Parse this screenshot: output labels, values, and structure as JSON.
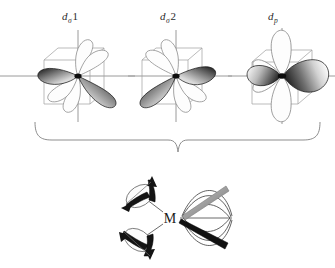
{
  "figure": {
    "title_present": false,
    "background_color": "#ffffff",
    "axis_color": "#9a9a9a",
    "outline_color": "#8d8d8d",
    "lobe_dark_color": "#1c1c1c",
    "lobe_light_color": "#f2f2f2",
    "brace_color": "#8d8d8d"
  },
  "orbitals": [
    {
      "id": "d-sigma-1",
      "label_base": "d",
      "label_sub": "σ",
      "label_num": "1",
      "full_label": "dσ1",
      "shape": "four-lobed cloverleaf, filled lobes on upper-left and lower-right diagonal",
      "center_x": 78,
      "center_y": 76
    },
    {
      "id": "d-sigma-2",
      "label_base": "d",
      "label_sub": "σ",
      "label_num": "2",
      "full_label": "dσ2",
      "shape": "four-lobed cloverleaf, filled lobes on upper-right and lower-left diagonal",
      "center_x": 176,
      "center_y": 76
    },
    {
      "id": "d-p",
      "label_base": "d",
      "label_sub": "p",
      "label_num": "",
      "full_label": "dp",
      "shape": "p-type orbital, filled lobes horizontal with small left lobe and large right lobe, open outline lobes vertical",
      "center_x": 282,
      "center_y": 76
    }
  ],
  "brace": {
    "orientation": "down",
    "left_x": 35,
    "right_x": 320,
    "tip_x": 178,
    "top_y": 122,
    "tip_y": 152
  },
  "complex": {
    "center_label": "M",
    "center_x": 170,
    "center_y": 218,
    "ligands": [
      {
        "id": "ligand-upper-left",
        "position": "upper-left",
        "style": "ellipse with filled arrow lobes"
      },
      {
        "id": "ligand-lower-left",
        "position": "lower-left",
        "style": "ellipse with filled arrow lobes"
      },
      {
        "id": "ligand-right-fan",
        "position": "right",
        "style": "fan of curved lines with gray and black bars"
      }
    ]
  }
}
